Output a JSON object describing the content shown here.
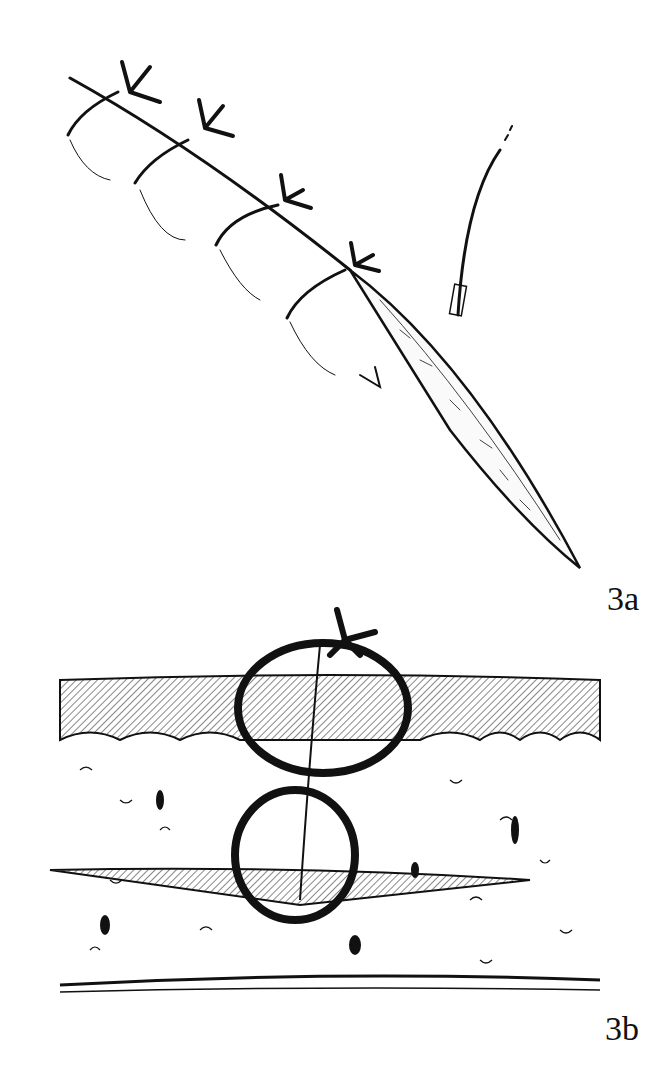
{
  "figure": {
    "panels": [
      {
        "id": "3a",
        "label": "3a",
        "description": "Running skin suture closure with interrupted tied knots along an incision; needle trailing at upper right"
      },
      {
        "id": "3b",
        "label": "3b",
        "description": "Cross-section of skin layers showing two stacked figure-eight suture loops through epidermis and dermis"
      }
    ],
    "colors": {
      "ink": "#111111",
      "background": "#ffffff"
    }
  }
}
